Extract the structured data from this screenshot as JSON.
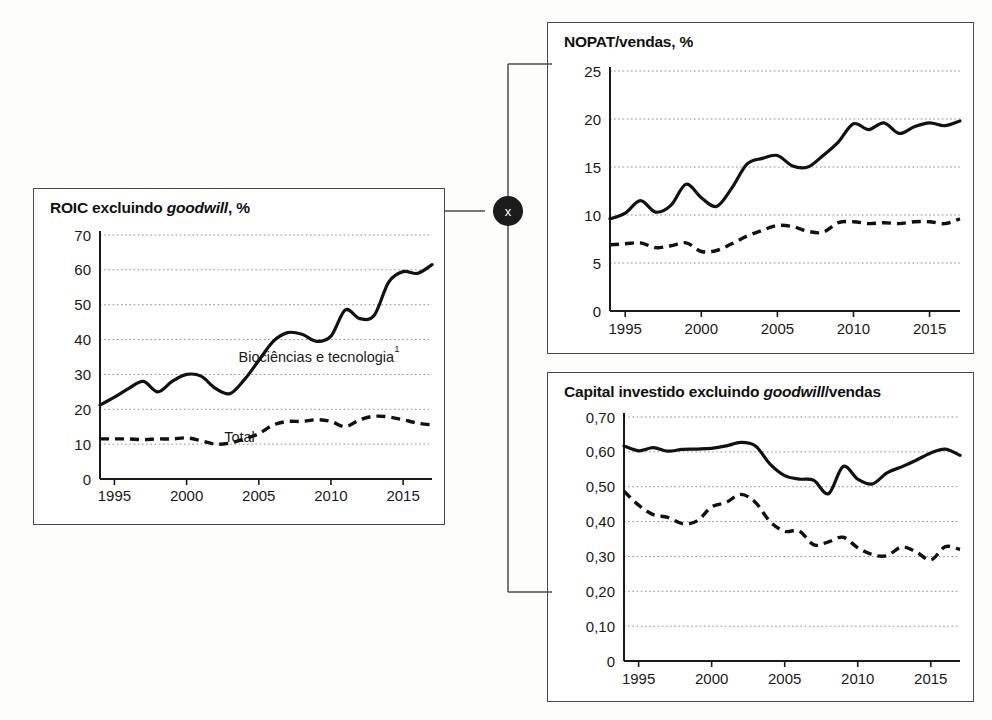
{
  "page": {
    "background_color": "#fdfdfb",
    "line_color": "#111111",
    "grid_color": "#8d8d8d",
    "border_color": "#4a4a4a"
  },
  "connector": {
    "operator_symbol": "x",
    "operator_name": "multiply-operator",
    "circle_color": "#1b1b1b",
    "symbol_color": "#ffffff"
  },
  "charts": [
    {
      "id": "roic",
      "title_prefix": "ROIC excluindo ",
      "title_italic": "goodwill",
      "title_suffix": ", %",
      "title_full": "ROIC excluindo goodwill, %",
      "annotations": {
        "solid_label": "Biociências e tecnologia",
        "solid_label_superscript": "1",
        "dashed_label": "Total"
      }
    },
    {
      "id": "nopat",
      "title_prefix": "NOPAT/vendas, %",
      "title_italic": "",
      "title_suffix": "",
      "title_full": "NOPAT/vendas, %",
      "annotations": {}
    },
    {
      "id": "capital",
      "title_prefix": "Capital investido excluindo ",
      "title_italic": "goodwill",
      "title_suffix": "/vendas",
      "title_full": "Capital investido excluindo goodwill/vendas",
      "annotations": {}
    }
  ],
  "chart_data": [
    {
      "id": "roic",
      "type": "line",
      "title": "ROIC excluindo goodwill, %",
      "xlabel": "",
      "ylabel": "",
      "grid": true,
      "legend": "inline-annotation",
      "xlim": [
        1994,
        2017
      ],
      "ylim": [
        0,
        70
      ],
      "yticks": [
        0,
        10,
        20,
        30,
        40,
        50,
        60,
        70
      ],
      "ytick_labels": [
        "0",
        "10",
        "20",
        "30",
        "40",
        "50",
        "60",
        "70"
      ],
      "xticks": [
        1995,
        2000,
        2005,
        2010,
        2015
      ],
      "xtick_labels": [
        "1995",
        "2000",
        "2005",
        "2010",
        "2015"
      ],
      "x": [
        1994,
        1995,
        1996,
        1997,
        1998,
        1999,
        2000,
        2001,
        2002,
        2003,
        2004,
        2005,
        2006,
        2007,
        2008,
        2009,
        2010,
        2011,
        2012,
        2013,
        2014,
        2015,
        2016,
        2017
      ],
      "series": [
        {
          "name": "Biociências e tecnologia",
          "style": "solid",
          "values": [
            21.2,
            23.5,
            26.0,
            28.0,
            25.0,
            28.0,
            30.0,
            29.5,
            26.0,
            24.5,
            28.5,
            34.0,
            39.5,
            42.0,
            41.5,
            39.5,
            41.0,
            48.5,
            46.0,
            47.0,
            56.5,
            59.5,
            59.0,
            61.5
          ]
        },
        {
          "name": "Total",
          "style": "dashed",
          "values": [
            11.5,
            11.5,
            11.5,
            11.3,
            11.5,
            11.5,
            11.8,
            11.0,
            10.0,
            10.3,
            11.5,
            13.0,
            15.5,
            16.5,
            16.5,
            17.0,
            16.5,
            15.0,
            17.0,
            18.0,
            17.8,
            17.0,
            16.0,
            15.5
          ]
        }
      ]
    },
    {
      "id": "nopat",
      "type": "line",
      "title": "NOPAT/vendas, %",
      "xlabel": "",
      "ylabel": "",
      "grid": true,
      "xlim": [
        1994,
        2017
      ],
      "ylim": [
        0,
        25
      ],
      "yticks": [
        0,
        5,
        10,
        15,
        20,
        25
      ],
      "ytick_labels": [
        "0",
        "5",
        "10",
        "15",
        "20",
        "25"
      ],
      "xticks": [
        1995,
        2000,
        2005,
        2010,
        2015
      ],
      "xtick_labels": [
        "1995",
        "2000",
        "2005",
        "2010",
        "2015"
      ],
      "x": [
        1994,
        1995,
        1996,
        1997,
        1998,
        1999,
        2000,
        2001,
        2002,
        2003,
        2004,
        2005,
        2006,
        2007,
        2008,
        2009,
        2010,
        2011,
        2012,
        2013,
        2014,
        2015,
        2016,
        2017
      ],
      "series": [
        {
          "name": "Biociências e tecnologia",
          "style": "solid",
          "values": [
            9.6,
            10.2,
            11.5,
            10.3,
            11.0,
            13.2,
            11.8,
            10.9,
            12.8,
            15.3,
            15.9,
            16.2,
            15.1,
            15.0,
            16.2,
            17.6,
            19.5,
            18.9,
            19.6,
            18.5,
            19.2,
            19.6,
            19.3,
            19.8
          ]
        },
        {
          "name": "Total",
          "style": "dashed",
          "values": [
            6.9,
            7.0,
            7.1,
            6.6,
            6.8,
            7.1,
            6.2,
            6.3,
            7.0,
            7.8,
            8.4,
            8.9,
            8.8,
            8.3,
            8.2,
            9.2,
            9.3,
            9.1,
            9.2,
            9.1,
            9.3,
            9.3,
            9.1,
            9.6
          ]
        }
      ]
    },
    {
      "id": "capital",
      "type": "line",
      "title": "Capital investido excluindo goodwill/vendas",
      "xlabel": "",
      "ylabel": "",
      "grid": true,
      "xlim": [
        1994,
        2017
      ],
      "ylim": [
        0,
        0.7
      ],
      "yticks": [
        0,
        0.1,
        0.2,
        0.3,
        0.4,
        0.5,
        0.6,
        0.7
      ],
      "ytick_labels": [
        "0",
        "0,10",
        "0,20",
        "0,30",
        "0,40",
        "0,50",
        "0,60",
        "0,70"
      ],
      "xticks": [
        1995,
        2000,
        2005,
        2010,
        2015
      ],
      "xtick_labels": [
        "1995",
        "2000",
        "2005",
        "2010",
        "2015"
      ],
      "x": [
        1994,
        1995,
        1996,
        1997,
        1998,
        1999,
        2000,
        2001,
        2002,
        2003,
        2004,
        2005,
        2006,
        2007,
        2008,
        2009,
        2010,
        2011,
        2012,
        2013,
        2014,
        2015,
        2016,
        2017
      ],
      "series": [
        {
          "name": "Biociências e tecnologia",
          "style": "solid",
          "values": [
            0.617,
            0.603,
            0.612,
            0.602,
            0.607,
            0.608,
            0.61,
            0.617,
            0.627,
            0.617,
            0.565,
            0.532,
            0.522,
            0.518,
            0.48,
            0.558,
            0.522,
            0.508,
            0.54,
            0.557,
            0.576,
            0.597,
            0.608,
            0.59
          ]
        },
        {
          "name": "Total",
          "style": "dashed",
          "values": [
            0.487,
            0.447,
            0.42,
            0.412,
            0.394,
            0.402,
            0.442,
            0.455,
            0.478,
            0.455,
            0.4,
            0.372,
            0.373,
            0.333,
            0.342,
            0.355,
            0.325,
            0.305,
            0.302,
            0.327,
            0.313,
            0.29,
            0.328,
            0.32
          ]
        }
      ]
    }
  ]
}
